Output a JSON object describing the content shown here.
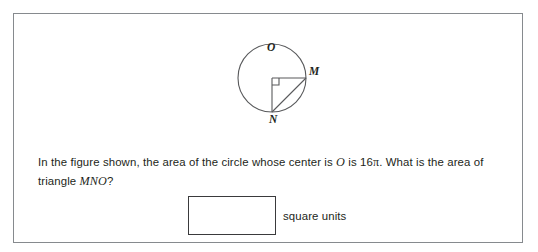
{
  "card": {
    "border_color": "#868a8e",
    "background": "#ffffff"
  },
  "figure": {
    "caption_vertices": [
      "O",
      "M",
      "N"
    ],
    "center_label": "O",
    "right_vertex_label": "M",
    "bottom_vertex_label": "N",
    "stroke_color": "#58595b",
    "shapes": {
      "circle": {
        "cx": 60,
        "cy": 56,
        "r": 34
      },
      "radius_om": {
        "x1": 60,
        "y1": 56,
        "x2": 94,
        "y2": 56
      },
      "radius_on": {
        "x1": 60,
        "y1": 56,
        "x2": 60,
        "y2": 90
      },
      "chord_mn": {
        "x1": 94,
        "y1": 56,
        "x2": 60,
        "y2": 90
      },
      "right_angle_marker": {
        "x": 60,
        "y": 56,
        "size": 7
      }
    }
  },
  "prompt": {
    "part1": "In the figure shown, the area of the circle whose center is ",
    "var1": "O",
    "part2": " is 16",
    "pi": "π",
    "part3": ". What is the area of triangle ",
    "var2": "MNO",
    "part4": "?"
  },
  "answer": {
    "value": "",
    "placeholder": "",
    "units_label": "square units"
  }
}
